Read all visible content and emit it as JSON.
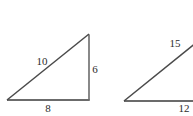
{
  "figure": {
    "type": "geometry-diagram",
    "background_color": "#ffffff",
    "stroke_color": "#666666",
    "label_color": "#2b2b2b",
    "stroke_width": 1.6,
    "canvas": {
      "width": 193,
      "height": 116
    },
    "shapes": [
      {
        "name": "triangle-left",
        "kind": "right-triangle",
        "vertices": {
          "bottom_left": {
            "x": 7,
            "y": 100
          },
          "bottom_right": {
            "x": 89,
            "y": 100
          },
          "apex": {
            "x": 89,
            "y": 34
          }
        },
        "edges": [
          {
            "name": "hypotenuse",
            "label": "10",
            "label_x": 42,
            "label_y": 61
          },
          {
            "name": "vertical-leg",
            "label": "6",
            "label_x": 95,
            "label_y": 69
          },
          {
            "name": "base-leg",
            "label": "8",
            "label_x": 48,
            "label_y": 108
          }
        ]
      },
      {
        "name": "triangle-right",
        "kind": "right-triangle",
        "clipped": true,
        "vertices": {
          "bottom_left": {
            "x": 124,
            "y": 101
          },
          "bottom_right": {
            "x": 207,
            "y": 101
          },
          "apex": {
            "x": 207,
            "y": 34
          }
        },
        "edges": [
          {
            "name": "hypotenuse",
            "label": "15",
            "label_x": 175,
            "label_y": 43
          },
          {
            "name": "base-leg",
            "label": "12",
            "label_x": 184,
            "label_y": 108
          }
        ]
      }
    ]
  },
  "labels": {
    "left_hypotenuse": "10",
    "left_vertical": "6",
    "left_base": "8",
    "right_hypotenuse": "15",
    "right_base": "12"
  }
}
